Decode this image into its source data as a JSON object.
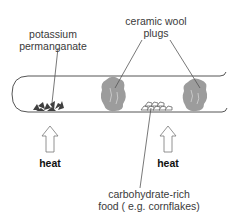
{
  "diagram": {
    "labels": {
      "potassium_permanganate": [
        "potassium",
        "permanganate"
      ],
      "ceramic_wool": [
        "ceramic wool",
        "plugs"
      ],
      "carbohydrate": [
        "carbohydrate-rich",
        "food ( e.g. cornflakes)"
      ],
      "heat_left": "heat",
      "heat_right": "heat"
    },
    "components": [
      "test-tube",
      "potassium-permanganate-crystals",
      "ceramic-wool-plug-left",
      "cornflakes",
      "ceramic-wool-plug-right",
      "heat-arrow-left",
      "heat-arrow-right"
    ],
    "colors": {
      "line": "#555555",
      "plug": "#9a9a9a",
      "crystals": "#444444"
    }
  }
}
